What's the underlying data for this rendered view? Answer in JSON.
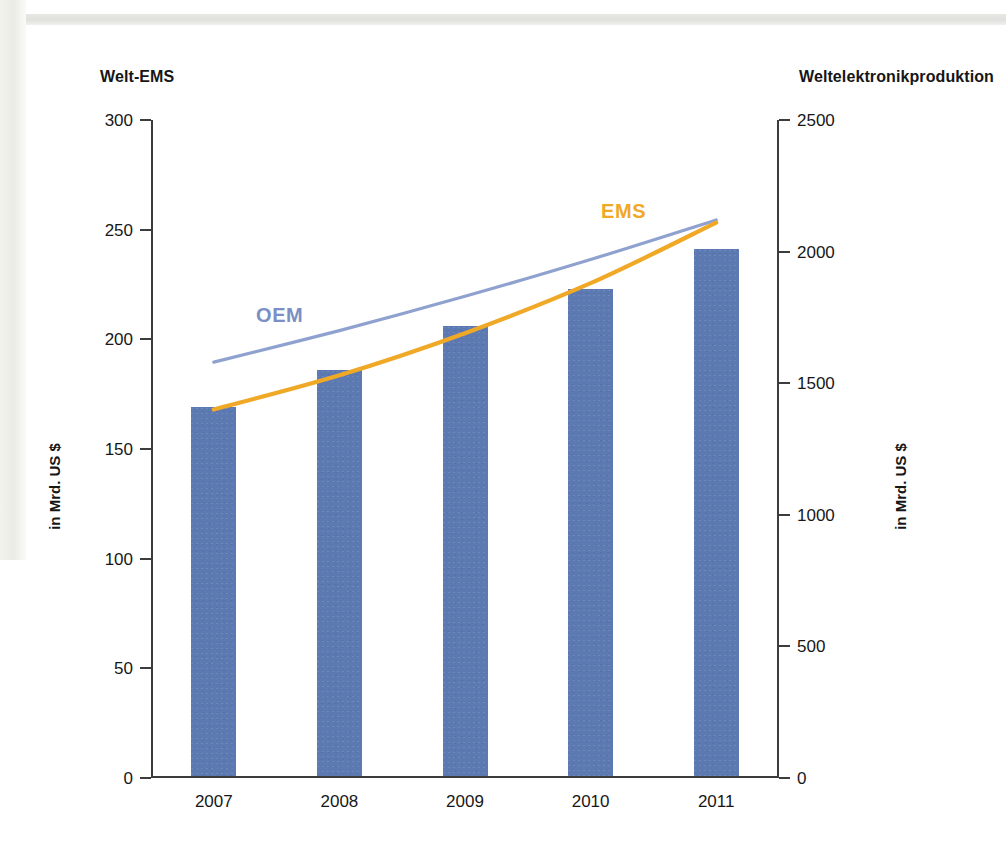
{
  "page": {
    "background_color": "#ffffff",
    "margin_strip_color": "#ececE6",
    "top_rule_color": "#e0e0dc"
  },
  "headers": {
    "left": "Welt-EMS",
    "right": "Weltelektronikproduktion"
  },
  "units": {
    "left": "in Mrd. US $",
    "right": "in Mrd. US $"
  },
  "axes": {
    "left": {
      "ticks": [
        "300",
        "250",
        "200",
        "150",
        "100",
        "50",
        "0"
      ],
      "min": 0,
      "max": 300
    },
    "right": {
      "ticks": [
        "2500",
        "2000",
        "1500",
        "1000",
        "500",
        "0"
      ],
      "min": 0,
      "max": 2500
    },
    "x": {
      "ticks": [
        "2007",
        "2008",
        "2009",
        "2010",
        "2011"
      ]
    }
  },
  "series_labels": {
    "oem": "OEM",
    "ems": "EMS"
  },
  "colors": {
    "bar_blue": "#5c7ab1",
    "oem_line": "#8fa1cf",
    "ems_line": "#f0a827",
    "axis": "#3c3c3c",
    "text": "#171717"
  },
  "chart_data": {
    "type": "bar",
    "title": "",
    "subtitle": "",
    "xlabel": "",
    "ylabel": "in Mrd. US $",
    "y2label": "in Mrd. US $",
    "categories": [
      "2007",
      "2008",
      "2009",
      "2010",
      "2011"
    ],
    "ylim": [
      0,
      300
    ],
    "y2lim": [
      0,
      2500
    ],
    "yticks": [
      0,
      50,
      100,
      150,
      200,
      250,
      300
    ],
    "y2ticks": [
      0,
      500,
      1000,
      1500,
      2000,
      2500
    ],
    "grid": false,
    "legend": "inline-annotations",
    "series": [
      {
        "name": "Welt-EMS",
        "type": "bar",
        "axis": "left",
        "color": "#5c7ab1",
        "values": [
          169,
          186,
          206,
          223,
          241
        ]
      },
      {
        "name": "OEM",
        "type": "line",
        "axis": "right",
        "color": "#8fa1cf",
        "values": [
          1580,
          1700,
          1830,
          1970,
          2120
        ],
        "x_start": "2007",
        "x_end": "2011"
      },
      {
        "name": "EMS",
        "type": "line",
        "axis": "right",
        "color": "#f0a827",
        "values": [
          1400,
          1530,
          1690,
          1880,
          2110
        ],
        "x_start": "2007",
        "x_end": "2011"
      }
    ],
    "annotations": [
      {
        "text": "OEM",
        "color": "#8fa1cf"
      },
      {
        "text": "EMS",
        "color": "#f0a827"
      }
    ]
  }
}
